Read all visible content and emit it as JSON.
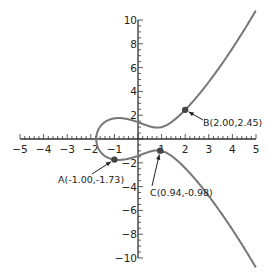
{
  "chart_data": {
    "type": "line",
    "title": "",
    "xlabel": "",
    "ylabel": "",
    "equation": "y^2 = x^3 - 2x + 2",
    "xlim": [
      -5,
      5
    ],
    "ylim": [
      -10,
      10
    ],
    "grid": false,
    "x_ticks": [
      -5,
      -4,
      -3,
      -2,
      -1,
      1,
      2,
      3,
      4,
      5
    ],
    "y_ticks": [
      -10,
      -8,
      -6,
      -4,
      -2,
      2,
      4,
      6,
      8,
      10
    ],
    "series": [
      {
        "name": "elliptic curve",
        "color": "#777777",
        "x": [
          -1.77,
          -1.7,
          -1.5,
          -1.0,
          -0.5,
          0,
          0.5,
          0.82,
          1.0,
          1.5,
          2.0,
          2.5,
          3.0,
          3.5,
          4.0,
          4.5,
          5.0
        ],
        "y_upper": [
          0,
          0.71,
          1.41,
          1.73,
          1.66,
          1.41,
          1.17,
          1.08,
          1.0,
          1.37,
          2.45,
          3.61,
          4.8,
          6.02,
          7.35,
          8.66,
          10.39
        ],
        "y_lower": [
          0,
          -0.71,
          -1.41,
          -1.73,
          -1.66,
          -1.41,
          -1.17,
          -1.08,
          -1.0,
          -1.37,
          -2.45,
          -3.61,
          -4.8,
          -6.02,
          -7.35,
          -8.66,
          -10.39
        ]
      }
    ],
    "points": [
      {
        "label": "A(-1.00,-1.73)",
        "x": -1.0,
        "y": -1.73
      },
      {
        "label": "B(2.00,2.45)",
        "x": 2.0,
        "y": 2.45
      },
      {
        "label": "C(0.94,-0.98)",
        "x": 0.94,
        "y": -0.98
      }
    ],
    "annotations": [
      {
        "text": "A(-1.00,-1.73)",
        "point": "A",
        "arrow": true
      },
      {
        "text": "B(2.00,2.45)",
        "point": "B",
        "arrow": true
      },
      {
        "text": "C(0.94,-0.98)",
        "point": "C",
        "arrow": true
      }
    ]
  }
}
